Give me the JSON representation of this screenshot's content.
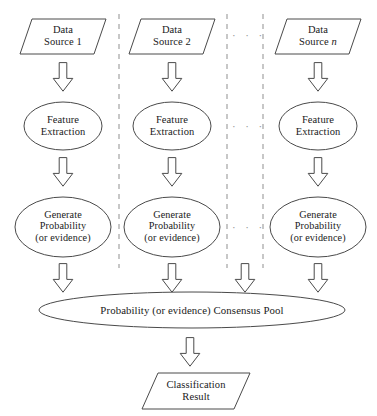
{
  "diagram": {
    "type": "flowchart",
    "stroke_color": "#4a4a4a",
    "divider_color": "#9a9a9a",
    "text_color": "#1a1a1a",
    "background": "#ffffff"
  },
  "columns": [
    {
      "id": "col-1",
      "center_x": 63,
      "source": {
        "line1": "Data",
        "line2": "Source 1"
      },
      "feature": {
        "line1": "Feature",
        "line2": "Extraction"
      },
      "generate": {
        "line1": "Generate",
        "line2": "Probability",
        "line3": "(or evidence)"
      }
    },
    {
      "id": "col-2",
      "center_x": 172,
      "source": {
        "line1": "Data",
        "line2": "Source 2"
      },
      "feature": {
        "line1": "Feature",
        "line2": "Extraction"
      },
      "generate": {
        "line1": "Generate",
        "line2": "Probability",
        "line3": "(or evidence)"
      }
    },
    {
      "id": "col-n",
      "center_x": 318,
      "source": {
        "line1": "Data",
        "line2": "Source",
        "italic_suffix": "n"
      },
      "feature": {
        "line1": "Feature",
        "line2": "Extraction"
      },
      "generate": {
        "line1": "Generate",
        "line2": "Probability",
        "line3": "(or evidence)"
      }
    }
  ],
  "ellipsis": {
    "glyph": "· · ·",
    "rows": [
      "sources",
      "feature-extraction",
      "generate-probability"
    ]
  },
  "pool": {
    "label": "Probability (or evidence) Consensus Pool"
  },
  "result": {
    "line1": "Classification",
    "line2": "Result"
  },
  "arrows": {
    "count_row_1": 3,
    "count_row_2": 3,
    "count_row_3": 4,
    "count_row_4": 1,
    "direction": "down"
  }
}
